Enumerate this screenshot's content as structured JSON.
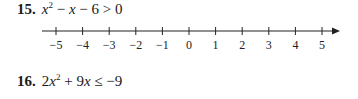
{
  "problems": [
    {
      "number": "15.",
      "expression_parts": [
        "x",
        "2",
        " − ",
        "x",
        " − 6 > 0"
      ],
      "expression_text": "x² − x − 6 > 0"
    },
    {
      "number": "16.",
      "expression_parts": [
        "2",
        "x",
        "2",
        " + 9",
        "x",
        " ≤ −9"
      ],
      "expression_text": "2x² + 9x ≤ −9"
    }
  ],
  "number_line": {
    "ticks": [
      "−5",
      "−4",
      "−3",
      "−2",
      "−1",
      "0",
      "1",
      "2",
      "3",
      "4",
      "5"
    ],
    "values": [
      -5,
      -4,
      -3,
      -2,
      -1,
      0,
      1,
      2,
      3,
      4,
      5
    ],
    "arrow": "right"
  }
}
